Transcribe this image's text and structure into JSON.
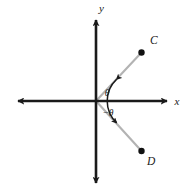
{
  "figure": {
    "background_color": "#ffffff",
    "axis_color": "#1a1a1a",
    "ray_color": "#b3b3b3",
    "point_color": "#111111",
    "arc_color": "#1a1a1a"
  },
  "axes": {
    "x_label": "x",
    "y_label": "y",
    "origin": {
      "x": 96,
      "y": 101
    },
    "x_axis": {
      "left_tip_x": 12,
      "right_tip_x": 173,
      "y": 101
    },
    "y_axis": {
      "top_tip_y": 14,
      "bottom_tip_y": 189,
      "x": 96
    }
  },
  "rays": [
    {
      "name": "ray-to-C",
      "angle_deg": 47.4,
      "end": {
        "x": 141,
        "y": 52
      },
      "point_label": "C",
      "label_pos": {
        "x": 150,
        "y": 44
      },
      "dot_radius": 3.2
    },
    {
      "name": "ray-to-D",
      "angle_deg": -47.4,
      "end": {
        "x": 141,
        "y": 151
      },
      "point_label": "D",
      "label_pos": {
        "x": 148,
        "y": 164
      },
      "dot_radius": 3.2
    }
  ],
  "angle_arc": {
    "upper_label": "θ",
    "lower_label": "−θ",
    "upper_label_pos": {
      "x": 105,
      "y": 95
    },
    "lower_label_pos": {
      "x": 102,
      "y": 115
    },
    "radius": 30,
    "sweep_start_deg": 47.4,
    "sweep_end_deg": -47.4,
    "double_headed": true
  }
}
